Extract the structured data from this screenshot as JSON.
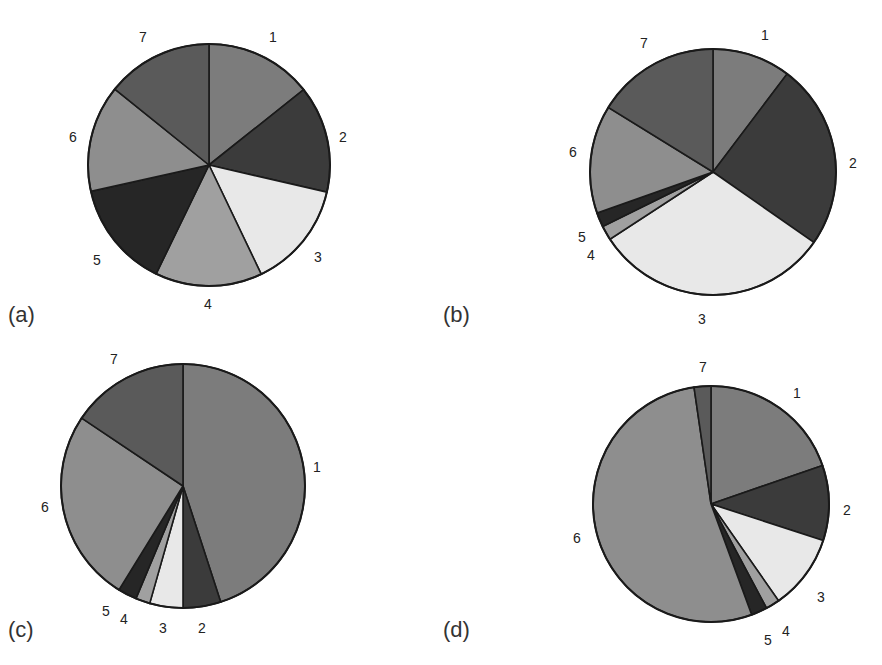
{
  "chart_data": [
    {
      "type": "pie",
      "panel": "(a)",
      "categories": [
        "1",
        "2",
        "3",
        "4",
        "5",
        "6",
        "7"
      ],
      "values": [
        14.3,
        14.3,
        14.3,
        14.3,
        14.3,
        14.3,
        14.2
      ],
      "units": "percent (estimated from slice angles)",
      "start_angle": "top, clockwise"
    },
    {
      "type": "pie",
      "panel": "(b)",
      "categories": [
        "1",
        "2",
        "3",
        "4",
        "5",
        "6",
        "7"
      ],
      "values": [
        10.3,
        24.4,
        31.1,
        1.9,
        1.9,
        14.2,
        16.2
      ],
      "units": "percent (estimated from slice angles)",
      "start_angle": "top, clockwise"
    },
    {
      "type": "pie",
      "panel": "(c)",
      "categories": [
        "1",
        "2",
        "3",
        "4",
        "5",
        "6",
        "7"
      ],
      "values": [
        45.0,
        5.0,
        4.4,
        1.9,
        2.5,
        25.6,
        15.6
      ],
      "units": "percent (estimated from slice angles)",
      "start_angle": "top, clockwise"
    },
    {
      "type": "pie",
      "panel": "(d)",
      "categories": [
        "1",
        "2",
        "3",
        "4",
        "5",
        "6",
        "7"
      ],
      "values": [
        19.7,
        10.3,
        10.3,
        1.9,
        2.2,
        53.3,
        2.3
      ],
      "units": "percent (estimated from slice angles)",
      "start_angle": "top, clockwise"
    }
  ],
  "slice_colors": [
    "#7c7c7c",
    "#3b3b3b",
    "#e8e8e8",
    "#a0a0a0",
    "#262626",
    "#8e8e8e",
    "#5a5a5a"
  ],
  "panels": [
    {
      "label": "(a)",
      "label_pos": [
        8,
        322
      ],
      "cx": 209,
      "cy": 165,
      "r": 121,
      "slice_labels": [
        {
          "text": "1",
          "x": 273,
          "y": 42
        },
        {
          "text": "2",
          "x": 343,
          "y": 142
        },
        {
          "text": "3",
          "x": 318,
          "y": 262
        },
        {
          "text": "4",
          "x": 208,
          "y": 309
        },
        {
          "text": "5",
          "x": 97,
          "y": 265
        },
        {
          "text": "6",
          "x": 73,
          "y": 142
        },
        {
          "text": "7",
          "x": 143,
          "y": 42
        }
      ]
    },
    {
      "label": "(b)",
      "label_pos": [
        443,
        322
      ],
      "cx": 713,
      "cy": 172,
      "r": 123,
      "slice_labels": [
        {
          "text": "1",
          "x": 765,
          "y": 40
        },
        {
          "text": "2",
          "x": 853,
          "y": 168
        },
        {
          "text": "3",
          "x": 702,
          "y": 324
        },
        {
          "text": "4",
          "x": 591,
          "y": 260
        },
        {
          "text": "5",
          "x": 582,
          "y": 242
        },
        {
          "text": "6",
          "x": 573,
          "y": 157
        },
        {
          "text": "7",
          "x": 644,
          "y": 48
        }
      ]
    },
    {
      "label": "(c)",
      "label_pos": [
        8,
        637
      ],
      "cx": 183,
      "cy": 486,
      "r": 122,
      "slice_labels": [
        {
          "text": "1",
          "x": 317,
          "y": 472
        },
        {
          "text": "2",
          "x": 202,
          "y": 633
        },
        {
          "text": "3",
          "x": 163,
          "y": 633
        },
        {
          "text": "4",
          "x": 124,
          "y": 624
        },
        {
          "text": "5",
          "x": 106,
          "y": 616
        },
        {
          "text": "6",
          "x": 45,
          "y": 512
        },
        {
          "text": "7",
          "x": 114,
          "y": 364
        }
      ]
    },
    {
      "label": "(d)",
      "label_pos": [
        443,
        637
      ],
      "cx": 711,
      "cy": 504,
      "r": 118,
      "slice_labels": [
        {
          "text": "1",
          "x": 797,
          "y": 398
        },
        {
          "text": "2",
          "x": 847,
          "y": 515
        },
        {
          "text": "3",
          "x": 821,
          "y": 602
        },
        {
          "text": "4",
          "x": 786,
          "y": 636
        },
        {
          "text": "5",
          "x": 768,
          "y": 645
        },
        {
          "text": "6",
          "x": 577,
          "y": 543
        },
        {
          "text": "7",
          "x": 703,
          "y": 372
        }
      ]
    }
  ]
}
